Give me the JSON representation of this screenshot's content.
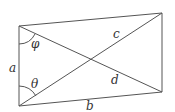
{
  "diagram": {
    "type": "quadrilateral-with-diagonals",
    "vertices": {
      "top_left": [
        19,
        26
      ],
      "bottom_left": [
        19,
        106
      ],
      "top_right": [
        162,
        13
      ],
      "bottom_right": [
        162,
        92
      ]
    },
    "stroke_color": "#555555",
    "labels": {
      "side_left": "a",
      "side_bottom": "b",
      "diagonal_upper": "c",
      "diagonal_lower": "d",
      "angle_top": "φ",
      "angle_bottom": "θ"
    }
  }
}
